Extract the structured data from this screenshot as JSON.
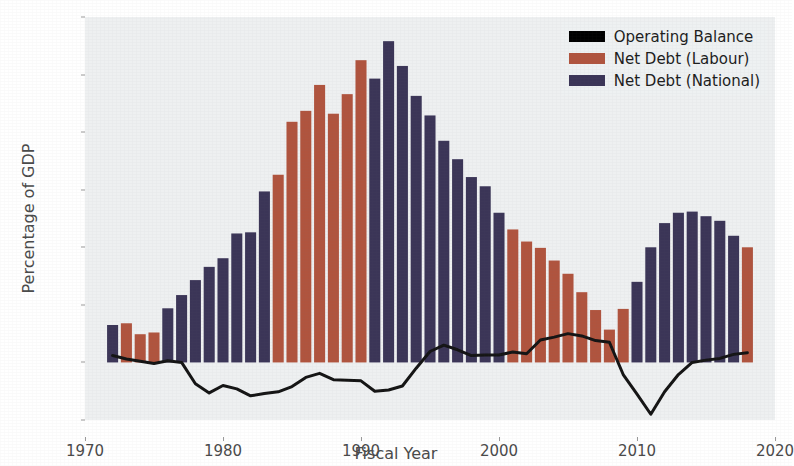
{
  "chart_data": {
    "type": "bar",
    "title": "",
    "xlabel": "Fiscal Year",
    "ylabel": "Percentage of GDP",
    "xlim": [
      1970,
      2020
    ],
    "ylim": [
      -10,
      60
    ],
    "xticks": [
      1970,
      1980,
      1990,
      2000,
      2010,
      2020
    ],
    "yticks": [
      -10,
      0,
      10,
      20,
      30,
      40,
      50,
      60
    ],
    "grid": false,
    "legend_position": "upper right",
    "legend": [
      {
        "label": "Operating Balance",
        "color": "#000000",
        "type": "line"
      },
      {
        "label": "Net Debt (Labour)",
        "color": "#b0543e",
        "type": "bar"
      },
      {
        "label": "Net Debt (National)",
        "color": "#3b3557",
        "type": "bar"
      }
    ],
    "x": [
      1972,
      1973,
      1974,
      1975,
      1976,
      1977,
      1978,
      1979,
      1980,
      1981,
      1982,
      1983,
      1984,
      1985,
      1986,
      1987,
      1988,
      1989,
      1990,
      1991,
      1992,
      1993,
      1994,
      1995,
      1996,
      1997,
      1998,
      1999,
      2000,
      2001,
      2002,
      2003,
      2004,
      2005,
      2006,
      2007,
      2008,
      2009,
      2010,
      2011,
      2012,
      2013,
      2014,
      2015,
      2016,
      2017,
      2018
    ],
    "bars": {
      "name": "Net Debt",
      "values": [
        6.5,
        6.8,
        4.9,
        5.2,
        9.4,
        11.7,
        14.3,
        16.6,
        18.1,
        22.4,
        22.6,
        29.7,
        32.6,
        41.8,
        43.7,
        48.2,
        43.2,
        46.6,
        52.5,
        49.3,
        55.8,
        51.5,
        46.3,
        42.9,
        38.5,
        35.3,
        32.2,
        30.6,
        26.0,
        23.1,
        21.0,
        19.9,
        17.7,
        15.4,
        12.2,
        9.1,
        5.7,
        9.3,
        14.0,
        20.0,
        24.2,
        26.0,
        26.2,
        25.4,
        24.6,
        22.0,
        20.0
      ],
      "colors": [
        "National",
        "Labour",
        "Labour",
        "Labour",
        "National",
        "National",
        "National",
        "National",
        "National",
        "National",
        "National",
        "National",
        "Labour",
        "Labour",
        "Labour",
        "Labour",
        "Labour",
        "Labour",
        "Labour",
        "National",
        "National",
        "National",
        "National",
        "National",
        "National",
        "National",
        "National",
        "National",
        "National",
        "Labour",
        "Labour",
        "Labour",
        "Labour",
        "Labour",
        "Labour",
        "Labour",
        "Labour",
        "Labour",
        "National",
        "National",
        "National",
        "National",
        "National",
        "National",
        "National",
        "National",
        "Labour"
      ]
    },
    "line": {
      "name": "Operating Balance",
      "x": [
        1972,
        1973,
        1974,
        1975,
        1976,
        1977,
        1978,
        1979,
        1980,
        1981,
        1982,
        1983,
        1984,
        1985,
        1986,
        1987,
        1988,
        1989,
        1990,
        1991,
        1992,
        1993,
        1994,
        1995,
        1996,
        1997,
        1998,
        1999,
        2000,
        2001,
        2002,
        2003,
        2004,
        2005,
        2006,
        2007,
        2008,
        2009,
        2010,
        2011,
        2012,
        2013,
        2014,
        2015,
        2016,
        2017,
        2018
      ],
      "values": [
        1.2,
        0.6,
        0.2,
        -0.2,
        0.3,
        0.0,
        -3.7,
        -5.3,
        -4.0,
        -4.6,
        -5.8,
        -5.4,
        -5.1,
        -4.2,
        -2.6,
        -1.9,
        -3.0,
        -3.1,
        -3.2,
        -5.0,
        -4.8,
        -4.1,
        -1.0,
        1.9,
        3.0,
        2.2,
        1.2,
        1.3,
        1.3,
        1.8,
        1.5,
        3.9,
        4.4,
        5.0,
        4.6,
        3.8,
        3.5,
        -2.1,
        -5.5,
        -9.0,
        -5.1,
        -2.1,
        0.0,
        0.4,
        0.7,
        1.4,
        1.7
      ]
    }
  },
  "axis": {
    "ylabel": "Percentage of GDP",
    "xlabel": "Fiscal Year",
    "ytick_labels": [
      "60",
      "50",
      "40",
      "30",
      "20",
      "10",
      "0",
      "−10"
    ],
    "xtick_labels": [
      "1970",
      "1980",
      "1990",
      "2000",
      "2010",
      "2020"
    ]
  },
  "colors": {
    "labour": "#b0543e",
    "national": "#3b3557",
    "operating_balance": "#141414",
    "plot_background": "#eef0f1",
    "figure_background": "#ffffff",
    "tick_text": "#4a4a4a"
  }
}
